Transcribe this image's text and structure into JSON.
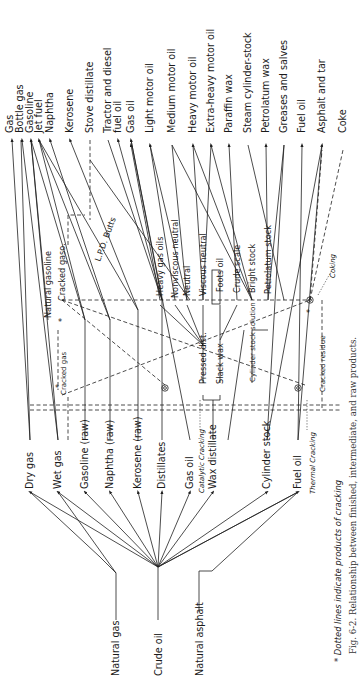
{
  "figure": {
    "caption": "Fig. 6-2. Relationship between finished, intermediate, and raw products.",
    "note": "* Dotted lines indicate products of cracking",
    "orientation": "rotated 90° counter-clockwise (text reads bottom-to-top)"
  },
  "finished_products": [
    {
      "id": "gas",
      "label": "Gas",
      "x": 10
    },
    {
      "id": "bottle-gas",
      "label": "Bottle gas",
      "x": 20
    },
    {
      "id": "gasoline",
      "label": "Gasoline",
      "x": 30
    },
    {
      "id": "jet-fuel",
      "label": "Jet fuel",
      "x": 39
    },
    {
      "id": "naphtha",
      "label": "Naphtha",
      "x": 50
    },
    {
      "id": "kerosene",
      "label": "Kerosene",
      "x": 70
    },
    {
      "id": "stove-distillate",
      "label": "Stove distillate",
      "x": 90
    },
    {
      "id": "tractor-diesel",
      "label": "Tractor and diesel",
      "x": 108
    },
    {
      "id": "fuel-oil-2",
      "label": "fuel oil",
      "x": 118
    },
    {
      "id": "gas-oil-fin",
      "label": "Gas oil",
      "x": 131
    },
    {
      "id": "light-motor-oil",
      "label": "Light motor oil",
      "x": 150
    },
    {
      "id": "medium-motor-oil",
      "label": "Medium motor oil",
      "x": 172
    },
    {
      "id": "heavy-motor-oil",
      "label": "Heavy motor oil",
      "x": 193
    },
    {
      "id": "extra-heavy-motor-oil",
      "label": "Extra-heavy motor oil",
      "x": 211
    },
    {
      "id": "paraffin-wax",
      "label": "Paraffin wax",
      "x": 229
    },
    {
      "id": "steam-cylinder-stock",
      "label": "Steam cylinder-stock",
      "x": 248
    },
    {
      "id": "petrolatum-wax",
      "label": "Petrolatum wax",
      "x": 266
    },
    {
      "id": "greases-salves",
      "label": "Greases and salves",
      "x": 284
    },
    {
      "id": "fuel-oil-fin",
      "label": "Fuel oil",
      "x": 302
    },
    {
      "id": "asphalt-tar",
      "label": "Asphalt and tar",
      "x": 322
    },
    {
      "id": "coke",
      "label": "Coke",
      "x": 343
    }
  ],
  "intermediate_products": [
    {
      "id": "natural-gasoline",
      "label": "Natural gasoline",
      "x": 48,
      "y": 315
    },
    {
      "id": "cracked-gaso",
      "label": "Cracked gaso.",
      "x": 63,
      "y": 300
    },
    {
      "id": "lpd-butts",
      "label": "L.P.D. Butts",
      "x": 101,
      "y": 262
    },
    {
      "id": "heavy-gas-oils",
      "label": "Heavy gas oils",
      "x": 160,
      "y": 296
    },
    {
      "id": "nonviscous-neutral",
      "label": "Nonviscous neutral",
      "x": 175,
      "y": 298
    },
    {
      "id": "neutral",
      "label": "Neutral",
      "x": 187,
      "y": 295
    },
    {
      "id": "viscous-neutral",
      "label": "Viscous neutral",
      "x": 203,
      "y": 296
    },
    {
      "id": "foots-oil",
      "label": "Foots oil",
      "x": 220,
      "y": 292
    },
    {
      "id": "crude-scale",
      "label": "Crude scale",
      "x": 237,
      "y": 293
    },
    {
      "id": "bright-stock",
      "label": "Bright stock",
      "x": 252,
      "y": 293
    },
    {
      "id": "petrolatum-stock",
      "label": "Petrolatum stock",
      "x": 268,
      "y": 294
    },
    {
      "id": "pressed-dist",
      "label": "Pressed dist.",
      "x": 203,
      "y": 384
    },
    {
      "id": "slack-wax",
      "label": "Slack wax",
      "x": 220,
      "y": 384
    },
    {
      "id": "cylinder-stock-solution",
      "label": "Cylinder stock solution",
      "x": 252,
      "y": 382
    },
    {
      "id": "cracked-gas",
      "label": "Cracked gas",
      "x": 64,
      "y": 395
    },
    {
      "id": "cracked-residue",
      "label": "Cracked residue",
      "x": 322,
      "y": 390
    }
  ],
  "raw_fractions": [
    {
      "id": "dry-gas",
      "label": "Dry gas",
      "x": 30
    },
    {
      "id": "wet-gas",
      "label": "Wet gas",
      "x": 58
    },
    {
      "id": "gasoline-raw",
      "label": "Gasoline (raw)",
      "x": 85
    },
    {
      "id": "naphtha-raw",
      "label": "Naphtha (raw)",
      "x": 110
    },
    {
      "id": "kerosene-raw",
      "label": "Kerosene (raw)",
      "x": 138
    },
    {
      "id": "distillates",
      "label": "Distillates",
      "x": 162
    },
    {
      "id": "gas-oil-raw",
      "label": "Gas oil",
      "x": 190
    },
    {
      "id": "wax-distillate",
      "label": "Wax distillate",
      "x": 213
    },
    {
      "id": "cylinder-stock",
      "label": "Cylinder stock",
      "x": 267
    },
    {
      "id": "fuel-oil-raw",
      "label": "Fuel oil",
      "x": 298
    }
  ],
  "processes": [
    {
      "id": "catalytic-cracking",
      "label": "Catalytic Cracking",
      "x": 201,
      "y": 432
    },
    {
      "id": "thermal-cracking",
      "label": "Thermal Cracking",
      "x": 312,
      "y": 432
    },
    {
      "id": "coking",
      "label": "Coking",
      "x": 332,
      "y": 275
    }
  ],
  "raw_materials": [
    {
      "id": "natural-gas",
      "label": "Natural gas",
      "x": 116
    },
    {
      "id": "crude-oil",
      "label": "Crude oil",
      "x": 158
    },
    {
      "id": "natural-asphalt",
      "label": "Natural asphalt",
      "x": 199
    }
  ],
  "colors": {
    "ink": "#1f1f1f",
    "paper": "#ffffff",
    "caption": "#333333"
  }
}
